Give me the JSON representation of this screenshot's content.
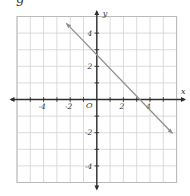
{
  "figure": {
    "cropped_text_fragment": "g"
  },
  "chart_data": {
    "type": "line",
    "title": "",
    "axes": {
      "xlabel": "x",
      "ylabel": "y",
      "origin_label": "O",
      "xlim": [
        -6,
        6
      ],
      "ylim": [
        -5,
        5
      ],
      "x_tick_labels": [
        -4,
        -2,
        2,
        4
      ],
      "y_tick_labels": [
        4,
        2,
        -2,
        -4
      ],
      "grid": true,
      "legend": "none"
    },
    "series": [
      {
        "name": "plotted-line",
        "equation": "y = -x + 3",
        "slope": -1,
        "y_intercept": 3,
        "x_intercept": 3,
        "endpoints": [
          [
            -2.3,
            4.6
          ],
          [
            5.7,
            -2.05
          ]
        ],
        "arrows_both_ends": true
      }
    ],
    "colors": {
      "axis": "#2e2e2e",
      "grid": "#cccccc",
      "border": "#b9b9b9",
      "line": "#8e8e8e",
      "label": "#333333",
      "background": "#ffffff"
    }
  }
}
